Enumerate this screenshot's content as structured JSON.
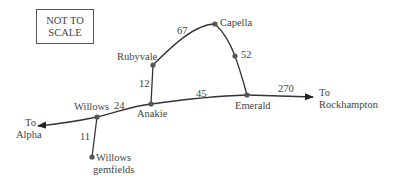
{
  "note": {
    "line1": "NOT TO",
    "line2": "SCALE"
  },
  "colors": {
    "line": "#333333",
    "node": "#555555",
    "text": "#444444",
    "border": "#555555"
  },
  "towns": {
    "rubyvale": "Rubyvale",
    "capella": "Capella",
    "anakie": "Anakie",
    "emerald": "Emerald",
    "willows": "Willows",
    "willows_gemfields_1": "Willows",
    "willows_gemfields_2": "gemfields"
  },
  "destinations": {
    "alpha_1": "To",
    "alpha_2": "Alpha",
    "rockhampton_1": "To",
    "rockhampton_2": "Rockhampton"
  },
  "distances": {
    "rubyvale_capella": "67",
    "capella_emerald": "52",
    "anakie_rubyvale": "12",
    "anakie_emerald": "45",
    "emerald_rockhampton": "270",
    "willows_anakie": "24",
    "willows_gemfields": "11"
  },
  "edges": [
    {
      "from": "Rubyvale",
      "to": "Capella",
      "km": 67
    },
    {
      "from": "Capella",
      "to": "Emerald",
      "km": 52
    },
    {
      "from": "Anakie",
      "to": "Rubyvale",
      "km": 12
    },
    {
      "from": "Anakie",
      "to": "Emerald",
      "km": 45
    },
    {
      "from": "Emerald",
      "to": "Rockhampton",
      "km": 270
    },
    {
      "from": "Willows",
      "to": "Anakie",
      "km": 24
    },
    {
      "from": "Willows",
      "to": "Willows gemfields",
      "km": 11
    },
    {
      "from": "Willows",
      "to": "Alpha",
      "km": null
    }
  ]
}
